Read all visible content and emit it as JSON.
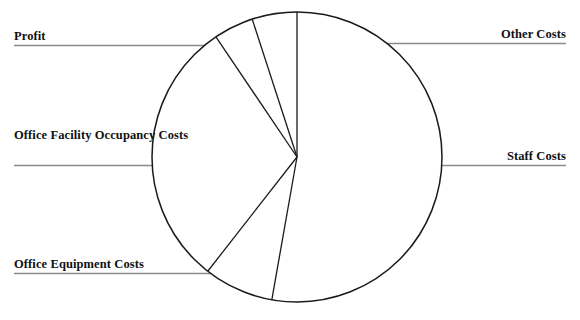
{
  "chart_data": {
    "type": "pie",
    "title": "",
    "subtitle": "",
    "xlabel": "",
    "ylabel": "",
    "legend_position": "callout-labels",
    "grid": false,
    "labels_shown_as": "leader-line callouts outside the pie",
    "categories": [
      "Staff Costs",
      "Office Equipment Costs",
      "Office Facility Occupancy Costs",
      "Profit",
      "Other Costs"
    ],
    "values": [
      52.8,
      7.8,
      30.0,
      4.4,
      5.0
    ],
    "units": "percent",
    "start_angle_deg": 0,
    "direction": "clockwise",
    "slices": [
      {
        "name": "Staff Costs",
        "value": 52.8,
        "start_deg": 0,
        "end_deg": 190,
        "label_side": "right"
      },
      {
        "name": "Office Equipment Costs",
        "value": 7.8,
        "start_deg": 190,
        "end_deg": 218,
        "label_side": "left"
      },
      {
        "name": "Office Facility Occupancy Costs",
        "value": 30.0,
        "start_deg": 218,
        "end_deg": 326,
        "label_side": "left"
      },
      {
        "name": "Profit",
        "value": 4.4,
        "start_deg": 326,
        "end_deg": 342,
        "label_side": "left"
      },
      {
        "name": "Other Costs",
        "value": 5.0,
        "start_deg": 342,
        "end_deg": 360,
        "label_side": "right"
      }
    ],
    "geometry": {
      "center_x": 297,
      "center_y": 157,
      "radius": 145
    },
    "style": {
      "stroke": "#1a1a1a",
      "fill": "#ffffff",
      "leader_line_color": "#808080",
      "text_color": "#111111"
    }
  },
  "labels": {
    "profit": "Profit",
    "other_costs": "Other Costs",
    "office_facility": "Office Facility\nOccupancy Costs",
    "staff_costs": "Staff Costs",
    "office_equipment": "Office Equipment Costs"
  }
}
